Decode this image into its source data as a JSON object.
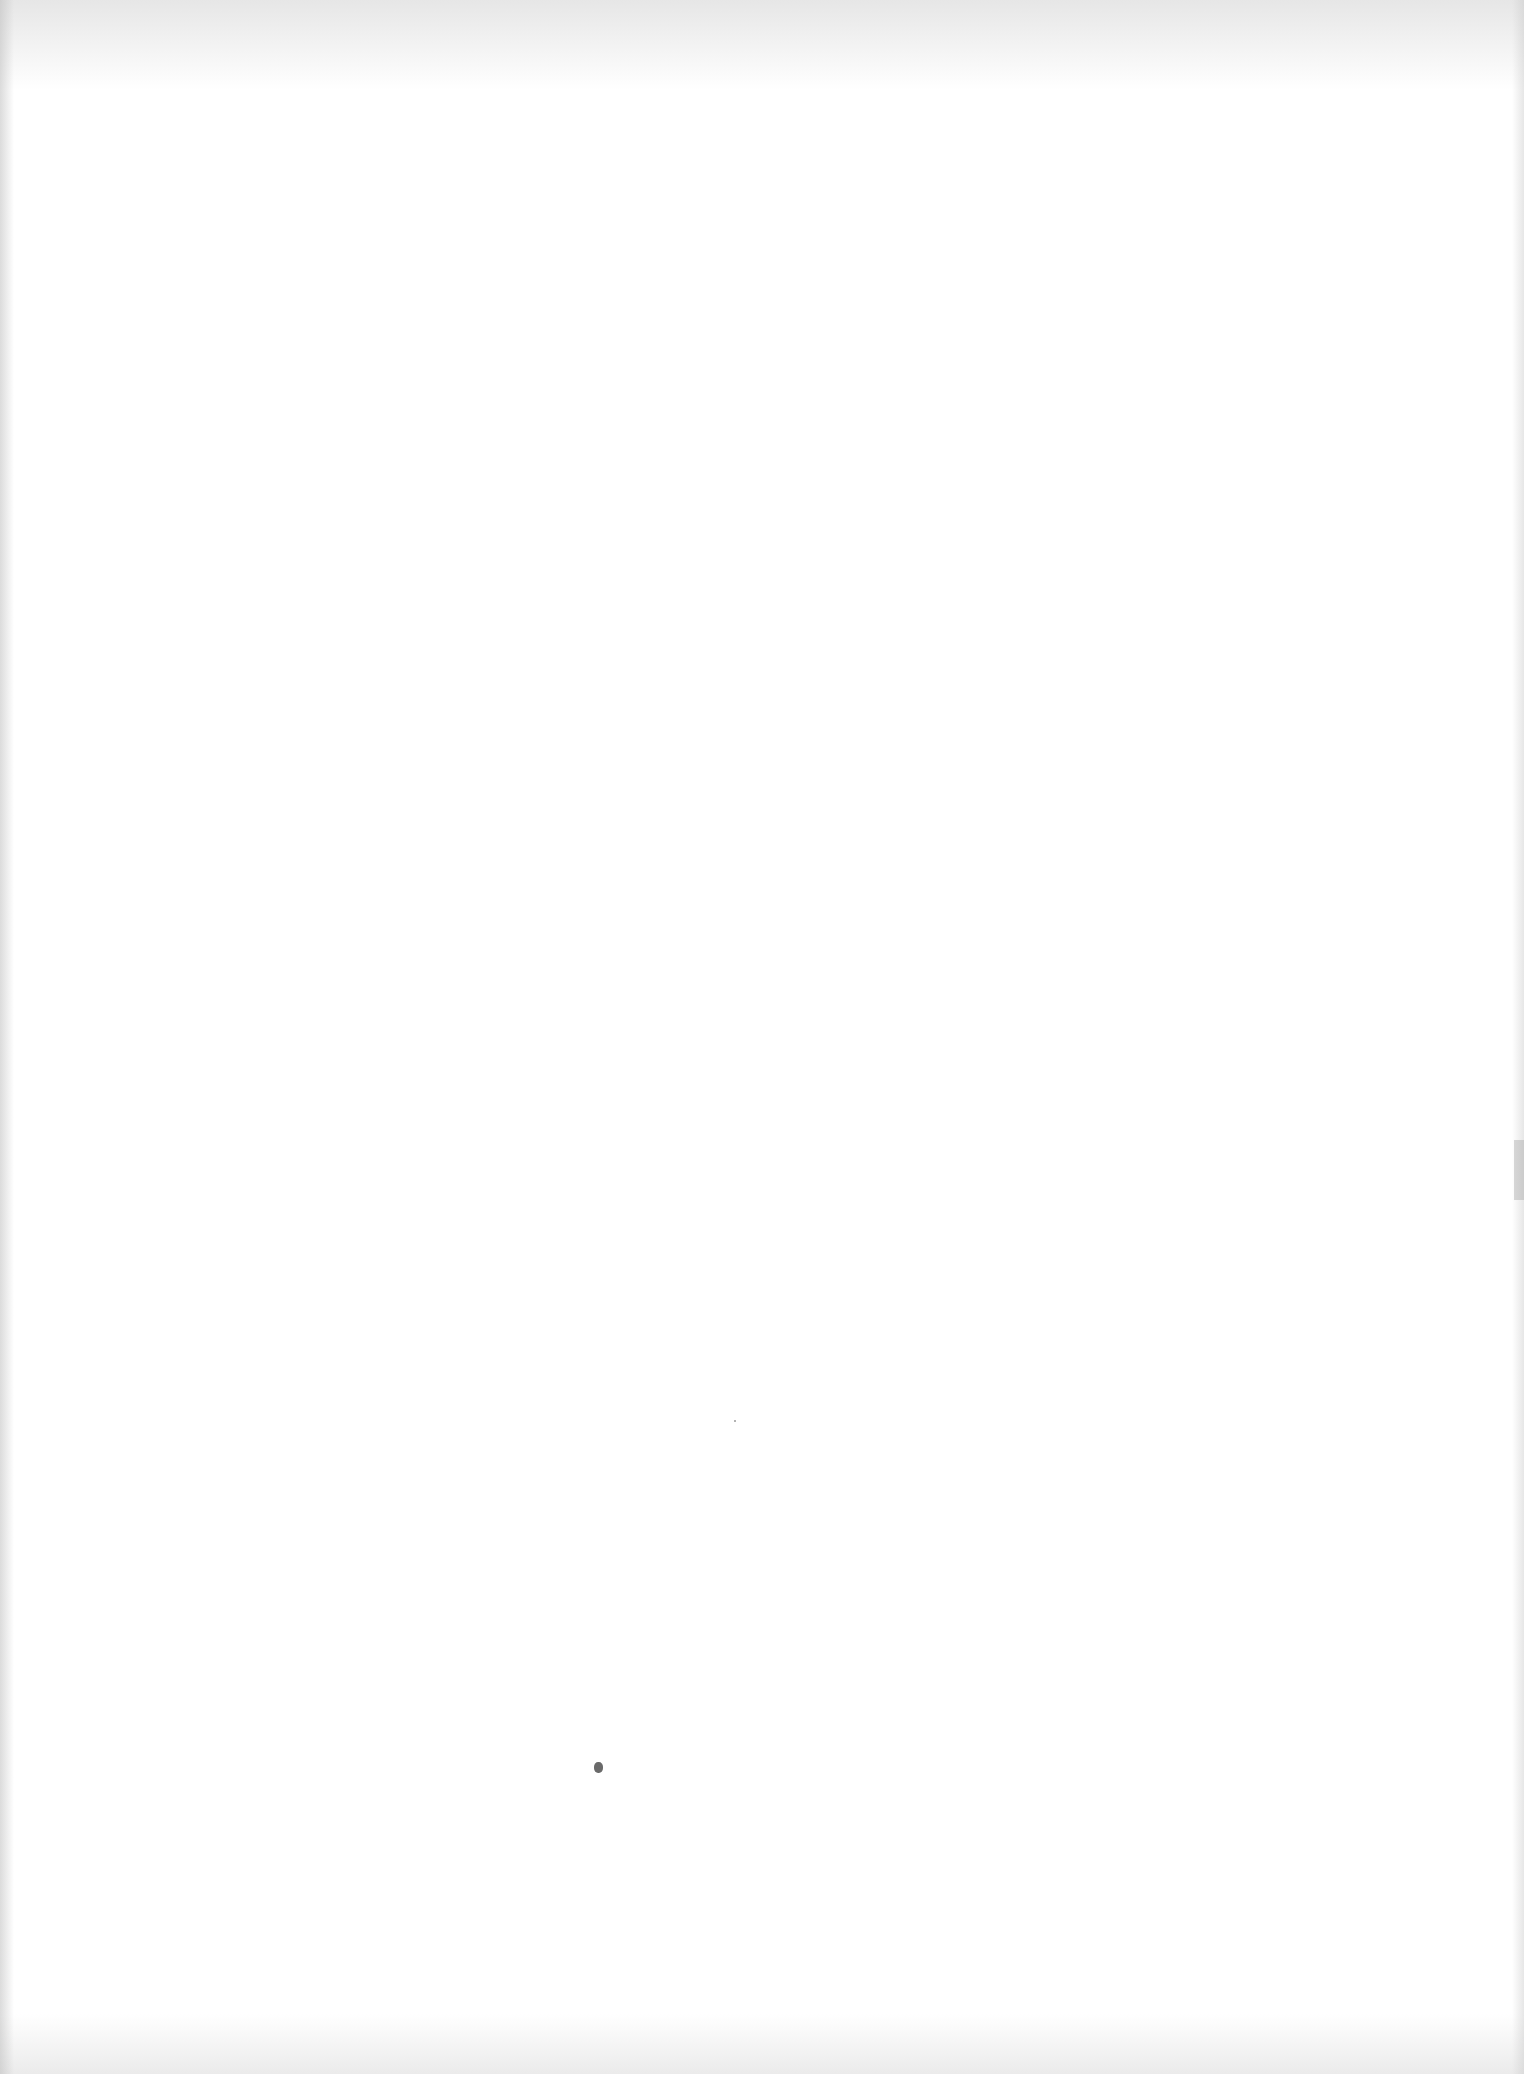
{
  "page": {
    "type": "blank-scanned-page",
    "text_content": ""
  }
}
